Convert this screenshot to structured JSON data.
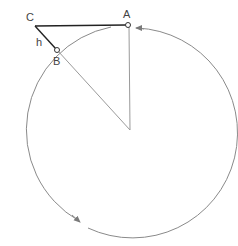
{
  "diagram": {
    "type": "geometry",
    "labels": {
      "A": "A",
      "B": "B",
      "C": "C",
      "h": "h"
    },
    "colors": {
      "circle": "#8a8a8a",
      "tangent_line": "#222222",
      "radius_lines": "#9a9a9a",
      "text": "#444444",
      "background": "#ffffff"
    },
    "points": {
      "center": [
        130,
        130
      ],
      "A": [
        128,
        25
      ],
      "B": [
        57,
        50
      ],
      "C": [
        35,
        25
      ]
    },
    "circle_radius": 105,
    "arrows": [
      {
        "name": "arrow-near-A",
        "direction": "counterclockwise",
        "position": [
          133,
          27
        ]
      },
      {
        "name": "arrow-bottom-left",
        "direction": "counterclockwise",
        "position": [
          80,
          222
        ]
      }
    ]
  }
}
